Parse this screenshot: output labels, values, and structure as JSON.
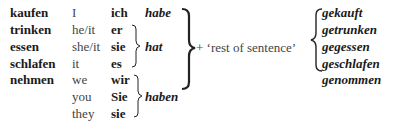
{
  "verbs": [
    "kaufen",
    "trinken",
    "essen",
    "schlafen",
    "nehmen"
  ],
  "english_pronouns": [
    "I",
    "he/it",
    "she/it",
    "it",
    "we",
    "you",
    "they"
  ],
  "german_pronouns": [
    "ich",
    "er",
    "sie",
    "es",
    "wir",
    "Sie",
    "sie"
  ],
  "auxiliaries": {
    "first": "habe",
    "third": "hat",
    "plural": "haben"
  },
  "connector": "+ ‘rest of sentence’",
  "participles": [
    "gekauft",
    "getrunken",
    "gegessen",
    "geschlafen",
    "genommen"
  ]
}
